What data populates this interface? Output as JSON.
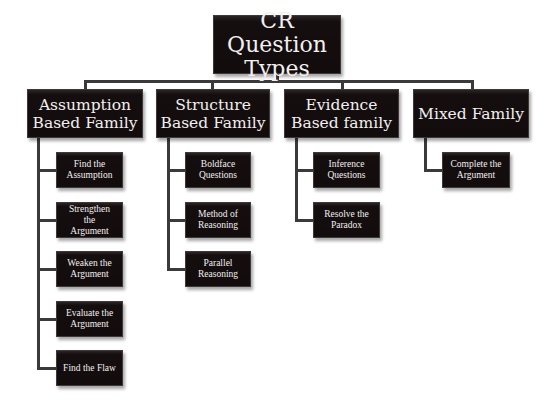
{
  "diagram": {
    "title": "CR Question Types",
    "root": {
      "label": "CR Question\nTypes"
    },
    "families": [
      {
        "label": "Assumption\nBased Family",
        "children": [
          "Find the\nAssumption",
          "Strengthen\nthe\nArgument",
          "Weaken the\nArgument",
          "Evaluate the\nArgument",
          "Find the Flaw"
        ]
      },
      {
        "label": "Structure\nBased Family",
        "children": [
          "Boldface\nQuestions",
          "Method of\nReasoning",
          "Parallel\nReasoning"
        ]
      },
      {
        "label": "Evidence\nBased family",
        "children": [
          "Inference\nQuestions",
          "Resolve the\nParadox"
        ]
      },
      {
        "label": "Mixed Family",
        "children": [
          "Complete the\nArgument"
        ]
      }
    ],
    "colors": {
      "box_fill": "#140e0f",
      "text": "#f2efee",
      "connector": "#3a3a3a",
      "background": "#ffffff"
    }
  }
}
